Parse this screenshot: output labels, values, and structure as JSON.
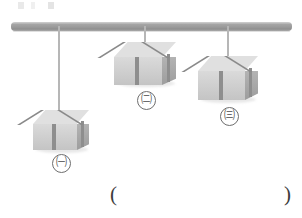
{
  "figure": {
    "type": "physics-diagram",
    "support_bar": {
      "name": "horizontal-bar",
      "color": "#9b9b9b"
    },
    "items": [
      {
        "id": "a",
        "label": "㈠",
        "string_length": "long",
        "box_size": "medium",
        "position": "left"
      },
      {
        "id": "b",
        "label": "㈡",
        "string_length": "short",
        "box_size": "large",
        "position": "center"
      },
      {
        "id": "c",
        "label": "㈢",
        "string_length": "medium",
        "box_size": "medium-large",
        "position": "right"
      }
    ],
    "answer_blank": {
      "open": "(",
      "close": ")",
      "value": ""
    }
  },
  "colors": {
    "bar": "#9b9b9b",
    "string": "#9e9e9e",
    "box_top": "#e0e0e0",
    "box_front": "#cfcfcf",
    "box_side": "#a6a6a6",
    "ribbon": "#8c8c8c",
    "label_text": "#4a4a4a"
  }
}
